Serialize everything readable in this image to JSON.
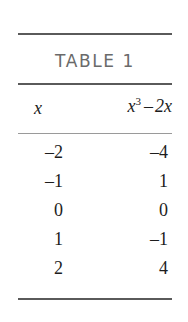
{
  "figure": {
    "caption": "TABLE 1",
    "caption_color": "#6a6a6a",
    "rule_color": "#5a5a5a",
    "rule_color_light": "#9a9a9a",
    "text_color": "#1d1d1d",
    "background": "#ffffff"
  },
  "columns": {
    "x_label": "x",
    "expr": {
      "base": "x",
      "exponent": "3",
      "operator": "–",
      "term": "2x",
      "full": "x³ – 2x"
    }
  },
  "chart_data": {
    "type": "table",
    "title": "TABLE 1",
    "columns": [
      "x",
      "x³ – 2x"
    ],
    "rows": [
      {
        "x": "–2",
        "y": "–4"
      },
      {
        "x": "–1",
        "y": "1"
      },
      {
        "x": "0",
        "y": "0"
      },
      {
        "x": "1",
        "y": "–1"
      },
      {
        "x": "2",
        "y": "4"
      }
    ],
    "x_values": [
      -2,
      -1,
      0,
      1,
      2
    ],
    "y_values": [
      -4,
      1,
      0,
      -1,
      4
    ],
    "xlabel": "x",
    "ylabel": "x^3 - 2x"
  }
}
